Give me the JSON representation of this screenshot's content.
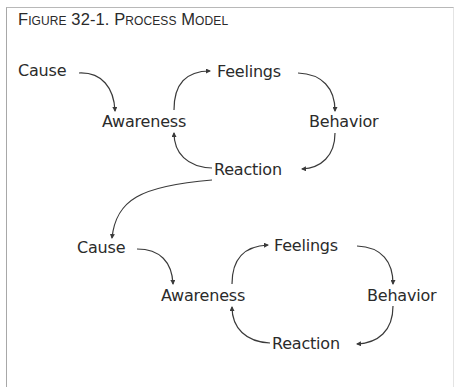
{
  "figure": {
    "title": "Figure 32-1. Process Model"
  },
  "cycles": [
    {
      "nodes": {
        "cause": "Cause",
        "awareness": "Awareness",
        "feelings": "Feelings",
        "behavior": "Behavior",
        "reaction": "Reaction"
      }
    },
    {
      "nodes": {
        "cause": "Cause",
        "awareness": "Awareness",
        "feelings": "Feelings",
        "behavior": "Behavior",
        "reaction": "Reaction"
      }
    }
  ],
  "edges": [
    {
      "from": "Cause",
      "to": "Awareness"
    },
    {
      "from": "Awareness",
      "to": "Feelings"
    },
    {
      "from": "Feelings",
      "to": "Behavior"
    },
    {
      "from": "Behavior",
      "to": "Reaction"
    },
    {
      "from": "Reaction",
      "to": "Awareness"
    },
    {
      "from": "Reaction (cycle 1)",
      "to": "Cause (cycle 2)"
    }
  ],
  "colors": {
    "text": "#2b2b2b",
    "line": "#3a3a3a",
    "border": "#a8a8a8"
  }
}
